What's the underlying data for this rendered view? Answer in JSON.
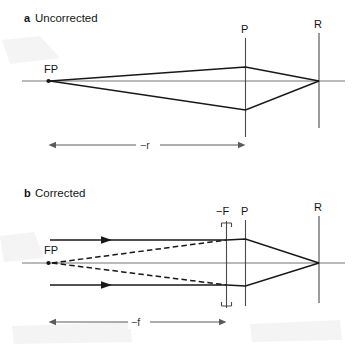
{
  "figure": {
    "type": "optical-ray-diagram",
    "width": 352,
    "height": 344,
    "background": "#ffffff",
    "ink_color": "#181818"
  },
  "panels": [
    {
      "id": "a",
      "letter": "a",
      "title": "Uncorrected",
      "letter_pos": {
        "x": 24,
        "y": 22
      },
      "title_pos": {
        "x": 35,
        "y": 22
      },
      "axis": {
        "x1": 22,
        "y": 81,
        "x2": 345
      },
      "focal_point": {
        "label": "FP",
        "label_x": 44,
        "label_y": 73,
        "dot_x": 48.5,
        "dot_y": 81,
        "dot_r": 2.1
      },
      "vertical_lines": [
        {
          "name": "P",
          "x": 245.5,
          "y1": 38,
          "y2": 137,
          "label": "P",
          "label_x": 241,
          "label_y": 33
        },
        {
          "name": "R",
          "x": 319,
          "y1": 33,
          "y2": 128,
          "label": "R",
          "label_x": 314,
          "label_y": 28
        }
      ],
      "ray_bundle": {
        "apex_left_x": 50,
        "apex_left_y": 81,
        "apex_right_x": 319,
        "apex_right_y": 81,
        "upper_vertex_x": 245.5,
        "upper_vertex_y": 67,
        "lower_vertex_x": 245.5,
        "lower_vertex_y": 110
      },
      "dimension": {
        "label": "−r",
        "label_x": 146,
        "label_y": 161,
        "y": 145,
        "x1": 48.5,
        "x2": 245.5
      }
    },
    {
      "id": "b",
      "letter": "b",
      "title": "Corrected",
      "letter_pos": {
        "x": 24,
        "y": 197
      },
      "title_pos": {
        "x": 35,
        "y": 197
      },
      "axis": {
        "x1": 22,
        "y": 263,
        "x2": 345
      },
      "focal_point": {
        "label": "FP",
        "label_x": 44,
        "label_y": 254,
        "dot_x": 48.5,
        "dot_y": 263,
        "dot_r": 2.1
      },
      "vertical_lines": [
        {
          "name": "-F",
          "x": 226.5,
          "y1": 221,
          "y2": 308,
          "label": "−F",
          "label_x": 218,
          "label_y": 215,
          "capped": true
        },
        {
          "name": "P",
          "x": 245.5,
          "y1": 220,
          "y2": 306,
          "label": "P",
          "label_x": 241,
          "label_y": 215
        },
        {
          "name": "R",
          "x": 319,
          "y1": 216,
          "y2": 303,
          "label": "R",
          "label_x": 314,
          "label_y": 211
        }
      ],
      "incoming_rays": [
        {
          "y": 240,
          "x_start": 50,
          "x_end": 226.5,
          "arrow_x": 105
        },
        {
          "y": 285,
          "x_start": 50,
          "x_end": 226.5,
          "arrow_x": 105
        }
      ],
      "virtual_rays_dashed": [
        {
          "x1": 50,
          "y1": 263,
          "x2": 226.5,
          "y2": 240
        },
        {
          "x1": 50,
          "y1": 263,
          "x2": 226.5,
          "y2": 285
        }
      ],
      "converging_rays": {
        "left_upper_x": 226.5,
        "left_upper_y": 240,
        "lens_upper_x": 245.5,
        "lens_upper_y": 239,
        "left_lower_x": 226.5,
        "left_lower_y": 285,
        "lens_lower_x": 245.5,
        "lens_lower_y": 286,
        "apex_x": 319,
        "apex_y": 263
      },
      "dimension": {
        "label": "−f",
        "label_x": 137,
        "label_y": 338,
        "y": 322,
        "x1": 48.5,
        "x2": 226.5
      }
    }
  ],
  "legend_notes": {
    "solid_line_meaning": "real ray path",
    "dashed_line_meaning": "virtual ray extension to far point"
  }
}
